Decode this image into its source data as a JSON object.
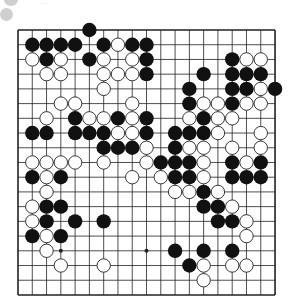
{
  "board": {
    "size": 19,
    "origin_x": 18,
    "origin_y": 30,
    "spacing_x": 14.28,
    "spacing_y": 14.72,
    "stone_radius": 7.2,
    "line_color": "#222222",
    "black_color": "#111111",
    "white_fill": "#ffffff",
    "white_stroke": "#222222",
    "star_points": [
      [
        3,
        15
      ],
      [
        9,
        15
      ]
    ],
    "black": [
      [
        0,
        5
      ],
      [
        1,
        1
      ],
      [
        1,
        2
      ],
      [
        1,
        3
      ],
      [
        1,
        4
      ],
      [
        1,
        6
      ],
      [
        1,
        8
      ],
      [
        1,
        9
      ],
      [
        2,
        2
      ],
      [
        2,
        5
      ],
      [
        2,
        9
      ],
      [
        2,
        15
      ],
      [
        3,
        9
      ],
      [
        3,
        13
      ],
      [
        3,
        15
      ],
      [
        3,
        16
      ],
      [
        3,
        17
      ],
      [
        4,
        12
      ],
      [
        4,
        15
      ],
      [
        4,
        16
      ],
      [
        4,
        18
      ],
      [
        5,
        12
      ],
      [
        5,
        15
      ],
      [
        6,
        4
      ],
      [
        6,
        7
      ],
      [
        6,
        9
      ],
      [
        6,
        13
      ],
      [
        7,
        1
      ],
      [
        7,
        2
      ],
      [
        7,
        4
      ],
      [
        7,
        5
      ],
      [
        7,
        6
      ],
      [
        7,
        9
      ],
      [
        7,
        11
      ],
      [
        7,
        12
      ],
      [
        7,
        13
      ],
      [
        8,
        6
      ],
      [
        8,
        7
      ],
      [
        8,
        8
      ],
      [
        8,
        11
      ],
      [
        9,
        10
      ],
      [
        9,
        11
      ],
      [
        9,
        12
      ],
      [
        9,
        15
      ],
      [
        9,
        17
      ],
      [
        10,
        1
      ],
      [
        10,
        3
      ],
      [
        10,
        11
      ],
      [
        10,
        12
      ],
      [
        10,
        15
      ],
      [
        10,
        16
      ],
      [
        10,
        17
      ],
      [
        11,
        13
      ],
      [
        12,
        2
      ],
      [
        12,
        3
      ],
      [
        12,
        13
      ],
      [
        12,
        14
      ],
      [
        13,
        2
      ],
      [
        13,
        4
      ],
      [
        13,
        6
      ],
      [
        13,
        14
      ],
      [
        13,
        15
      ],
      [
        14,
        1
      ],
      [
        14,
        3
      ],
      [
        15,
        11
      ],
      [
        15,
        13
      ],
      [
        15,
        15
      ],
      [
        16,
        12
      ]
    ],
    "white": [
      [
        1,
        7
      ],
      [
        2,
        1
      ],
      [
        2,
        3
      ],
      [
        2,
        6
      ],
      [
        2,
        8
      ],
      [
        2,
        16
      ],
      [
        2,
        17
      ],
      [
        3,
        2
      ],
      [
        3,
        3
      ],
      [
        3,
        6
      ],
      [
        3,
        7
      ],
      [
        3,
        8
      ],
      [
        4,
        6
      ],
      [
        4,
        17
      ],
      [
        5,
        3
      ],
      [
        5,
        4
      ],
      [
        5,
        8
      ],
      [
        5,
        13
      ],
      [
        5,
        14
      ],
      [
        5,
        16
      ],
      [
        5,
        17
      ],
      [
        6,
        2
      ],
      [
        6,
        5
      ],
      [
        6,
        6
      ],
      [
        6,
        8
      ],
      [
        6,
        12
      ],
      [
        6,
        14
      ],
      [
        6,
        15
      ],
      [
        7,
        7
      ],
      [
        7,
        8
      ],
      [
        7,
        14
      ],
      [
        7,
        17
      ],
      [
        8,
        9
      ],
      [
        8,
        12
      ],
      [
        8,
        13
      ],
      [
        8,
        15
      ],
      [
        8,
        17
      ],
      [
        9,
        1
      ],
      [
        9,
        2
      ],
      [
        9,
        3
      ],
      [
        9,
        4
      ],
      [
        9,
        6
      ],
      [
        9,
        9
      ],
      [
        9,
        13
      ],
      [
        9,
        16
      ],
      [
        10,
        2
      ],
      [
        10,
        8
      ],
      [
        10,
        10
      ],
      [
        10,
        13
      ],
      [
        11,
        2
      ],
      [
        11,
        11
      ],
      [
        11,
        12
      ],
      [
        11,
        14
      ],
      [
        12,
        1
      ],
      [
        12,
        15
      ],
      [
        13,
        1
      ],
      [
        13,
        16
      ],
      [
        14,
        2
      ],
      [
        14,
        16
      ],
      [
        15,
        2
      ],
      [
        16,
        3
      ],
      [
        16,
        6
      ],
      [
        16,
        13
      ],
      [
        16,
        15
      ],
      [
        16,
        16
      ],
      [
        17,
        13
      ]
    ]
  },
  "header": {
    "partial_text": "···"
  }
}
